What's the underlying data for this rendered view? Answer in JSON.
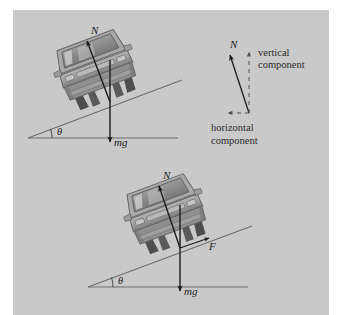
{
  "figure": {
    "panel_color": "#c9c9c9",
    "page_background": "#ffffff",
    "ink_color": "#1b1b1b",
    "car_body_color": "#a3a3a3",
    "car_shadow_color": "#6e6e6e",
    "car_window_color": "#8a8a8a",
    "wheel_color": "#4a4a4a"
  },
  "diagram_top": {
    "normal_force_label": "N",
    "weight_label": "mg",
    "angle_label": "θ"
  },
  "diagram_bottom": {
    "normal_force_label": "N",
    "weight_label": "mg",
    "friction_label": "F",
    "angle_label": "θ"
  },
  "vector_inset": {
    "resultant_label": "N",
    "vertical_component_line1": "vertical",
    "vertical_component_line2": "component",
    "horizontal_component_line1": "horizontal",
    "horizontal_component_line2": "component"
  }
}
